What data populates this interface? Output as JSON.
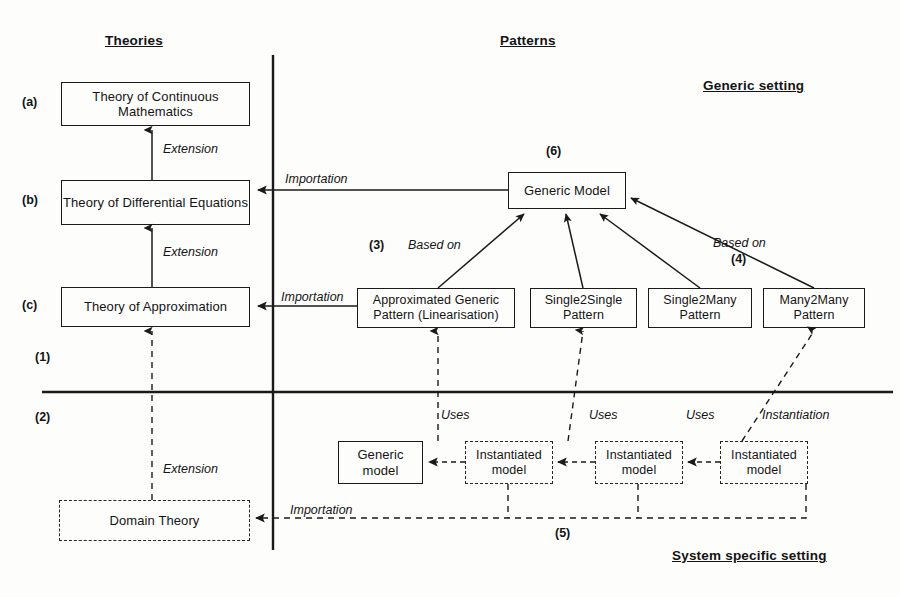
{
  "headings": {
    "theories": "Theories",
    "patterns": "Patterns",
    "generic_setting": "Generic setting",
    "system_specific_setting": "System specific setting"
  },
  "row_tags": {
    "a": "(a)",
    "b": "(b)",
    "c": "(c)",
    "one": "(1)",
    "two": "(2)"
  },
  "nodes": {
    "theory_continuous_math": "Theory of Continuous Mathematics",
    "theory_differential_equations": "Theory of Differential Equations",
    "theory_approximation": "Theory of Approximation",
    "domain_theory": "Domain Theory",
    "generic_model_pattern": "Generic Model",
    "approximated_generic_pattern": "Approximated Generic Pattern (Linearisation)",
    "single2single_pattern": "Single2Single Pattern",
    "single2many_pattern": "Single2Many Pattern",
    "many2many_pattern": "Many2Many Pattern",
    "generic_model_instance": "Generic model",
    "instantiated_model_1": "Instantiated model",
    "instantiated_model_2": "Instantiated model",
    "instantiated_model_3": "Instantiated model"
  },
  "edge_labels": {
    "extension_a_b": "Extension",
    "extension_b_c": "Extension",
    "extension_c_domain": "Extension",
    "importation_b": "Importation",
    "importation_c": "Importation",
    "importation_domain": "Importation",
    "based_on_3": "Based on",
    "based_on_4": "Based on",
    "uses_1": "Uses",
    "uses_2": "Uses",
    "uses_3": "Uses",
    "instantiation": "Instantiation"
  },
  "numbered_tags": {
    "three": "(3)",
    "four": "(4)",
    "five": "(5)",
    "six": "(6)"
  },
  "colors": {
    "stroke": "#1a1a1a",
    "text": "#141414",
    "background": "#fdfdfc"
  }
}
